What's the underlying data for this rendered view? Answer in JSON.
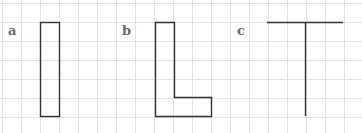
{
  "figure": {
    "grid_color": "#e2e2e2",
    "shape_color": "#333333",
    "panels": [
      {
        "label": "a",
        "shape": "vertical-bar"
      },
      {
        "label": "b",
        "shape": "L-shape"
      },
      {
        "label": "c",
        "shape": "T-shape"
      }
    ]
  }
}
